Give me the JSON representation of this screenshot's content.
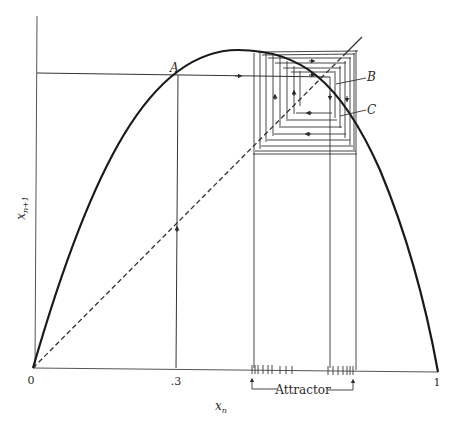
{
  "figure": {
    "type": "cobweb-diagram",
    "axes": {
      "x_label": "x",
      "x_label_sub": "n",
      "y_label": "x",
      "y_label_sub": "n+1",
      "x_ticks": [
        {
          "label": "0",
          "value": 0
        },
        {
          "label": ".3",
          "value": 0.3
        },
        {
          "label": "1",
          "value": 1
        }
      ]
    },
    "points": [
      {
        "label": "A"
      },
      {
        "label": "B"
      },
      {
        "label": "C"
      }
    ],
    "attractor_label": "Attractor",
    "colors": {
      "line": "#2a2a2a",
      "curve": "#1a1a1a",
      "background": "#ffffff"
    }
  }
}
